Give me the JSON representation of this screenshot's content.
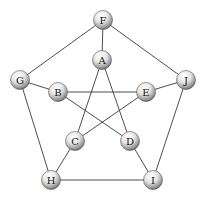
{
  "diagram": {
    "type": "graph",
    "nodes": [
      {
        "id": "F",
        "label": "F",
        "x": 103,
        "y": 20
      },
      {
        "id": "A",
        "label": "A",
        "x": 102,
        "y": 60
      },
      {
        "id": "G",
        "label": "G",
        "x": 20,
        "y": 80
      },
      {
        "id": "J",
        "label": "J",
        "x": 186,
        "y": 80
      },
      {
        "id": "B",
        "label": "B",
        "x": 58,
        "y": 92
      },
      {
        "id": "E",
        "label": "E",
        "x": 146,
        "y": 92
      },
      {
        "id": "C",
        "label": "C",
        "x": 75,
        "y": 141
      },
      {
        "id": "D",
        "label": "D",
        "x": 130,
        "y": 141
      },
      {
        "id": "H",
        "label": "H",
        "x": 51,
        "y": 180
      },
      {
        "id": "I",
        "label": "I",
        "x": 153,
        "y": 180
      }
    ],
    "edges": [
      [
        "F",
        "A"
      ],
      [
        "F",
        "G"
      ],
      [
        "F",
        "J"
      ],
      [
        "G",
        "B"
      ],
      [
        "J",
        "E"
      ],
      [
        "G",
        "H"
      ],
      [
        "J",
        "I"
      ],
      [
        "H",
        "I"
      ],
      [
        "H",
        "C"
      ],
      [
        "I",
        "D"
      ],
      [
        "B",
        "E"
      ],
      [
        "A",
        "C"
      ],
      [
        "A",
        "D"
      ],
      [
        "B",
        "D"
      ],
      [
        "E",
        "C"
      ]
    ],
    "node_radius": 9.5
  }
}
